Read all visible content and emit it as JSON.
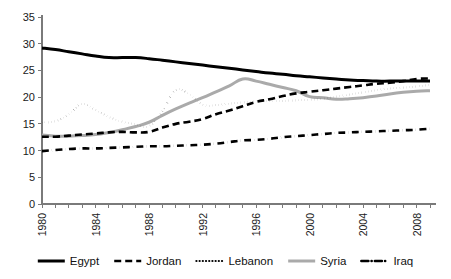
{
  "chart_data": {
    "type": "line",
    "title": "",
    "xlabel": "",
    "ylabel": "",
    "xlim": [
      1980,
      2009
    ],
    "ylim": [
      0,
      35
    ],
    "grid": false,
    "legend_position": "bottom",
    "y_ticks": [
      0,
      5,
      10,
      15,
      20,
      25,
      30,
      35
    ],
    "x_ticks": [
      1980,
      1984,
      1988,
      1992,
      1996,
      2000,
      2004,
      2008
    ],
    "x_minor_ticks": [
      1981,
      1982,
      1983,
      1985,
      1986,
      1987,
      1989,
      1990,
      1991,
      1993,
      1994,
      1995,
      1997,
      1998,
      1999,
      2001,
      2002,
      2003,
      2005,
      2006,
      2007,
      2009
    ],
    "x": [
      1980,
      1981,
      1982,
      1983,
      1984,
      1985,
      1986,
      1987,
      1988,
      1989,
      1990,
      1991,
      1992,
      1993,
      1994,
      1995,
      1996,
      1997,
      1998,
      1999,
      2000,
      2001,
      2002,
      2003,
      2004,
      2005,
      2006,
      2007,
      2008,
      2009
    ],
    "series": [
      {
        "name": "Egypt",
        "style": "solid",
        "color": "#000000",
        "width": 3.0,
        "values": [
          29.2,
          28.9,
          28.5,
          28.1,
          27.7,
          27.4,
          27.4,
          27.4,
          27.2,
          26.9,
          26.6,
          26.3,
          26.0,
          25.7,
          25.4,
          25.1,
          24.8,
          24.5,
          24.3,
          24.0,
          23.8,
          23.6,
          23.4,
          23.2,
          23.1,
          23.0,
          23.0,
          23.0,
          23.0,
          23.0
        ]
      },
      {
        "name": "Jordan",
        "style": "dashed",
        "color": "#000000",
        "width": 2.6,
        "values": [
          12.6,
          12.6,
          12.8,
          13.0,
          13.2,
          13.4,
          13.5,
          13.4,
          13.5,
          14.3,
          15.0,
          15.4,
          15.9,
          16.8,
          17.5,
          18.3,
          19.1,
          19.6,
          20.2,
          20.7,
          21.0,
          21.3,
          21.6,
          21.9,
          22.2,
          22.5,
          22.7,
          23.0,
          23.4,
          23.5
        ]
      },
      {
        "name": "Lebanon",
        "style": "dotted",
        "color": "#000000",
        "width": 2.2,
        "values": [
          15.3,
          15.5,
          16.8,
          18.7,
          17.6,
          16.3,
          15.4,
          14.9,
          14.6,
          17.4,
          21.3,
          20.5,
          18.6,
          18.5,
          18.8,
          19.0,
          19.2,
          19.3,
          19.3,
          19.4,
          19.5,
          19.7,
          20.1,
          20.5,
          20.9,
          21.3,
          21.6,
          21.8,
          22.0,
          22.3
        ]
      },
      {
        "name": "Syria",
        "style": "solid",
        "color": "#aaaaaa",
        "width": 3.0,
        "values": [
          12.9,
          12.7,
          12.7,
          12.8,
          13.0,
          13.4,
          13.9,
          14.5,
          15.3,
          16.6,
          17.8,
          18.9,
          19.9,
          21.0,
          22.1,
          23.4,
          23.0,
          22.4,
          21.8,
          21.2,
          20.1,
          19.9,
          19.6,
          19.7,
          19.9,
          20.2,
          20.6,
          20.9,
          21.1,
          21.2
        ]
      },
      {
        "name": "Iraq",
        "style": "dashdot",
        "color": "#000000",
        "width": 2.6,
        "values": [
          9.9,
          10.1,
          10.3,
          10.4,
          10.4,
          10.5,
          10.6,
          10.7,
          10.8,
          10.8,
          10.9,
          11.0,
          11.1,
          11.3,
          11.6,
          11.9,
          12.0,
          12.2,
          12.5,
          12.7,
          12.9,
          13.1,
          13.3,
          13.4,
          13.5,
          13.6,
          13.7,
          13.8,
          13.9,
          14.1
        ]
      }
    ]
  },
  "legend": {
    "items": [
      {
        "label": "Egypt"
      },
      {
        "label": "Jordan"
      },
      {
        "label": "Lebanon"
      },
      {
        "label": "Syria"
      },
      {
        "label": "Iraq"
      }
    ]
  }
}
